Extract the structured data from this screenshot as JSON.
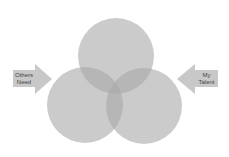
{
  "diagram": {
    "type": "venn",
    "circles": [
      {
        "name": "top",
        "cx": 116,
        "cy": 56,
        "r": 38
      },
      {
        "name": "left",
        "cx": 85,
        "cy": 105,
        "r": 38
      },
      {
        "name": "right",
        "cx": 144,
        "cy": 106,
        "r": 38
      }
    ],
    "circle_fill": "#a8a8a8",
    "circle_opacity": 0.6,
    "arrow_fill": "#c8c8c8",
    "arrows": {
      "left": {
        "line1": "Others",
        "line2": "Need"
      },
      "right": {
        "line1": "My",
        "line2": "Talent"
      }
    }
  }
}
